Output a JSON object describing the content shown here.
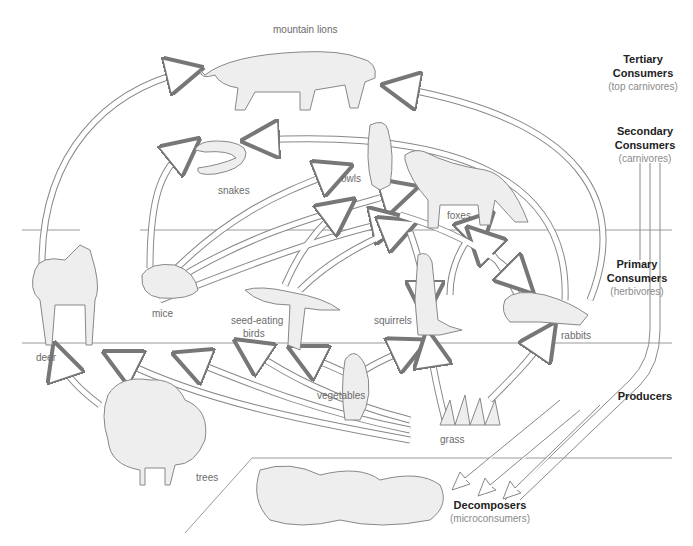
{
  "diagram": {
    "type": "food web",
    "organisms": [
      {
        "id": "mountain_lions",
        "label": "mountain lions",
        "level": "tertiary"
      },
      {
        "id": "snakes",
        "label": "snakes",
        "level": "secondary"
      },
      {
        "id": "owls",
        "label": "owls",
        "level": "secondary"
      },
      {
        "id": "foxes",
        "label": "foxes",
        "level": "secondary"
      },
      {
        "id": "deer",
        "label": "deer",
        "level": "primary"
      },
      {
        "id": "mice",
        "label": "mice",
        "level": "primary"
      },
      {
        "id": "seed_eating_birds",
        "label": "seed-eating birds",
        "label_line1": "seed-eating",
        "label_line2": "birds",
        "level": "primary"
      },
      {
        "id": "squirrels",
        "label": "squirrels",
        "level": "primary"
      },
      {
        "id": "rabbits",
        "label": "rabbits",
        "level": "primary"
      },
      {
        "id": "trees",
        "label": "trees",
        "level": "producer"
      },
      {
        "id": "vegetables",
        "label": "vegetables",
        "level": "producer"
      },
      {
        "id": "grass",
        "label": "grass",
        "level": "producer"
      },
      {
        "id": "decomposers",
        "label": "decomposers",
        "level": "decomposer"
      }
    ],
    "levels": {
      "tertiary": {
        "title": "Tertiary",
        "title2": "Consumers",
        "subtitle": "(top carnivores)"
      },
      "secondary": {
        "title": "Secondary",
        "title2": "Consumers",
        "subtitle": "(carnivores)"
      },
      "primary": {
        "title": "Primary",
        "title2": "Consumers",
        "subtitle": "(herbivores)"
      },
      "producers": {
        "title": "Producers"
      },
      "decomposers": {
        "title": "Decomposers",
        "subtitle": "(microconsumers)"
      }
    },
    "edges": [
      [
        "deer",
        "mountain_lions"
      ],
      [
        "mice",
        "snakes"
      ],
      [
        "mice",
        "owls"
      ],
      [
        "mice",
        "foxes"
      ],
      [
        "seed_eating_birds",
        "owls"
      ],
      [
        "seed_eating_birds",
        "foxes"
      ],
      [
        "squirrels",
        "foxes"
      ],
      [
        "squirrels",
        "owls"
      ],
      [
        "rabbits",
        "foxes"
      ],
      [
        "rabbits",
        "mountain_lions"
      ],
      [
        "rabbits",
        "snakes"
      ],
      [
        "trees",
        "deer"
      ],
      [
        "grass",
        "deer"
      ],
      [
        "grass",
        "mice"
      ],
      [
        "vegetables",
        "mice"
      ],
      [
        "vegetables",
        "seed_eating_birds"
      ],
      [
        "vegetables",
        "squirrels"
      ],
      [
        "grass",
        "squirrels"
      ],
      [
        "grass",
        "rabbits"
      ],
      [
        "consumers",
        "decomposers"
      ]
    ]
  }
}
